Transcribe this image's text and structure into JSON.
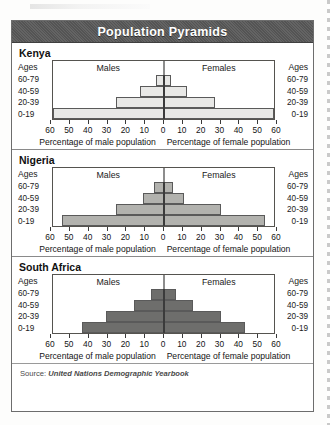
{
  "title": "Population Pyramids",
  "source_prefix": "Source:",
  "source_name": "United Nations Demographic Yearbook",
  "labels": {
    "ages": "Ages",
    "males": "Males",
    "females": "Females",
    "xlabel_male": "Percentage of male population",
    "xlabel_female": "Percentage of female population"
  },
  "colors": {
    "title_bar": "#585858",
    "title_text": "#ffffff",
    "kenya_bar": "#e8e8e6",
    "nigeria_bar": "#b2b2ae",
    "south_africa_bar": "#6e6e6c",
    "bar_border": "#5a5a5a",
    "axis": "#1c1c1c",
    "frame": "#6d6d6d"
  },
  "axis": {
    "ticks": [
      "60",
      "50",
      "40",
      "30",
      "20",
      "10",
      "0",
      "10",
      "20",
      "30",
      "40",
      "50",
      "60"
    ],
    "max": 60,
    "min": 0
  },
  "age_groups": [
    "60-79",
    "40-59",
    "20-39",
    "0-19"
  ],
  "chart_data": [
    {
      "type": "bar",
      "title": "Kenya",
      "orientation": "horizontal-diverging",
      "categories": [
        "60-79",
        "40-59",
        "20-39",
        "0-19"
      ],
      "series": [
        {
          "name": "Males",
          "values": [
            4,
            13,
            26,
            60
          ]
        },
        {
          "name": "Females",
          "values": [
            4,
            13,
            28,
            60
          ]
        }
      ],
      "xlabel": "Percentage of male population / Percentage of female population",
      "ylabel": "Ages",
      "xlim": [
        0,
        60
      ],
      "grid": false,
      "legend": "inline-top"
    },
    {
      "type": "bar",
      "title": "Nigeria",
      "orientation": "horizontal-diverging",
      "categories": [
        "60-79",
        "40-59",
        "20-39",
        "0-19"
      ],
      "series": [
        {
          "name": "Males",
          "values": [
            5,
            11,
            26,
            55
          ]
        },
        {
          "name": "Females",
          "values": [
            5,
            11,
            31,
            55
          ]
        }
      ],
      "xlabel": "Percentage of male population / Percentage of female population",
      "ylabel": "Ages",
      "xlim": [
        0,
        60
      ],
      "grid": false,
      "legend": "inline-top"
    },
    {
      "type": "bar",
      "title": "South Africa",
      "orientation": "horizontal-diverging",
      "categories": [
        "60-79",
        "40-59",
        "20-39",
        "0-19"
      ],
      "series": [
        {
          "name": "Males",
          "values": [
            7,
            16,
            31,
            44
          ]
        },
        {
          "name": "Females",
          "values": [
            7,
            16,
            31,
            44
          ]
        }
      ],
      "xlabel": "Percentage of male population / Percentage of female population",
      "ylabel": "Ages",
      "xlim": [
        0,
        60
      ],
      "grid": false,
      "legend": "inline-top"
    }
  ]
}
